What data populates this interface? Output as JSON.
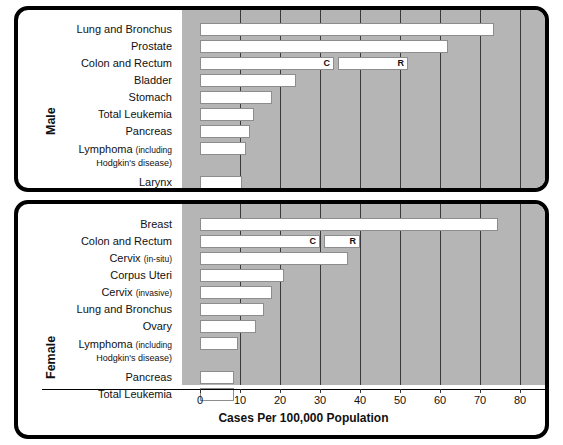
{
  "chart_data": {
    "type": "bar",
    "title": "",
    "xlabel": "Cases Per 100,000 Population",
    "ylabel": "",
    "xlim": [
      0,
      88
    ],
    "xticks": [
      0,
      10,
      20,
      30,
      40,
      50,
      60,
      70,
      80
    ],
    "xticklabels": [
      "0",
      "10",
      "20",
      "30",
      "40",
      "50",
      "60",
      "70",
      "80"
    ],
    "grid": true,
    "legend": "none",
    "segment_keys": {
      "C": "Colon",
      "R": "Rectum"
    },
    "panels": [
      {
        "group_label": "Male",
        "categories": [
          "Lung and Bronchus",
          "Prostate",
          "Colon and Rectum",
          "Bladder",
          "Stomach",
          "Total Leukemia",
          "Pancreas",
          "Lymphoma (including Hodgkin's disease)",
          "Larynx",
          "Kidney"
        ],
        "values": [
          73.5,
          62,
          52,
          24,
          18,
          13.5,
          12.5,
          11.5,
          10.5,
          9.5
        ],
        "split_bars": [
          {
            "category": "Colon and Rectum",
            "segments": [
              {
                "label": "C",
                "start": 0,
                "end": 33.5
              },
              {
                "label": "R",
                "start": 34.5,
                "end": 52
              }
            ]
          }
        ]
      },
      {
        "group_label": "Female",
        "categories": [
          "Breast",
          "Colon and Rectum",
          "Cervix (in-situ)",
          "Corpus Uteri",
          "Cervix (invasive)",
          "Lung and Bronchus",
          "Ovary",
          "Lymphoma (including Hodgkin's disease)",
          "Pancreas",
          "Total Leukemia"
        ],
        "values": [
          74.5,
          40,
          37,
          21,
          18,
          16,
          14,
          9.5,
          8.5,
          8.5
        ],
        "split_bars": [
          {
            "category": "Colon and Rectum",
            "segments": [
              {
                "label": "C",
                "start": 0,
                "end": 30
              },
              {
                "label": "R",
                "start": 31,
                "end": 40
              }
            ]
          }
        ]
      }
    ]
  },
  "male": {
    "group_label": "Male",
    "cats": [
      {
        "main": "Lung and Bronchus"
      },
      {
        "main": "Prostate"
      },
      {
        "main": "Colon and Rectum"
      },
      {
        "main": "Bladder"
      },
      {
        "main": "Stomach"
      },
      {
        "main": "Total Leukemia"
      },
      {
        "main": "Pancreas"
      },
      {
        "main": "Lymphoma ",
        "small": "(including",
        "sub": "Hodgkin's disease)"
      },
      {
        "main": "Larynx"
      },
      {
        "main": "Kidney"
      }
    ],
    "seg_c": "C",
    "seg_r": "R"
  },
  "female": {
    "group_label": "Female",
    "cats": [
      {
        "main": "Breast"
      },
      {
        "main": "Colon and Rectum"
      },
      {
        "main": "Cervix ",
        "small": "(in-situ)"
      },
      {
        "main": "Corpus Uteri"
      },
      {
        "main": "Cervix ",
        "small": "(invasive)"
      },
      {
        "main": "Lung and Bronchus"
      },
      {
        "main": "Ovary"
      },
      {
        "main": "Lymphoma ",
        "small": "(including",
        "sub": "Hodgkin's disease)"
      },
      {
        "main": "Pancreas"
      },
      {
        "main": "Total Leukemia"
      }
    ],
    "seg_c": "C",
    "seg_r": "R"
  },
  "axis": {
    "title": "Cases Per 100,000 Population",
    "labels": [
      "0",
      "10",
      "20",
      "30",
      "40",
      "50",
      "60",
      "70",
      "80"
    ]
  },
  "colors": {
    "plot_background": "#b5b5b5",
    "bar_fill": "#ffffff",
    "frame": "#000000",
    "gridline": "#3a3a3a"
  }
}
